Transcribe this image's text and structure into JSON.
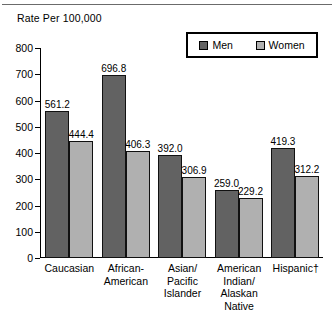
{
  "chart": {
    "axis_title": "Rate Per 100,000",
    "legend": [
      {
        "label": "Men",
        "swatch": "men-swatch",
        "color": "#626262"
      },
      {
        "label": "Women",
        "swatch": "women-swatch",
        "color": "#b0b0b0"
      }
    ]
  },
  "chart_data": {
    "type": "bar",
    "title": "",
    "xlabel": "",
    "ylabel": "Rate Per 100,000",
    "ylim": [
      0,
      800
    ],
    "yticks": [
      0,
      100,
      200,
      300,
      400,
      500,
      600,
      700,
      800
    ],
    "ytick_labels": [
      "0",
      "100",
      "200",
      "300",
      "400",
      "500",
      "600",
      "700",
      "800"
    ],
    "grid": false,
    "legend_position": "top-right",
    "categories": [
      "Caucasian",
      "African-American",
      "Asian/ Pacific Islander",
      "American Indian/ Alaskan Native",
      "Hispanic†"
    ],
    "category_lines": [
      [
        "Caucasian"
      ],
      [
        "African-",
        "American"
      ],
      [
        "Asian/",
        "Pacific",
        "Islander"
      ],
      [
        "American",
        "Indian/",
        "Alaskan Native"
      ],
      [
        "Hispanic†"
      ]
    ],
    "series": [
      {
        "name": "Men",
        "color": "#626262",
        "values": [
          561.2,
          696.8,
          392.0,
          259.0,
          419.3
        ],
        "labels": [
          "561.2",
          "696.8",
          "392.0",
          "259.0",
          "419.3"
        ]
      },
      {
        "name": "Women",
        "color": "#b0b0b0",
        "values": [
          444.4,
          406.3,
          306.9,
          229.2,
          312.2
        ],
        "labels": [
          "444.4",
          "406.3",
          "306.9",
          "229.2",
          "312.2"
        ]
      }
    ]
  }
}
